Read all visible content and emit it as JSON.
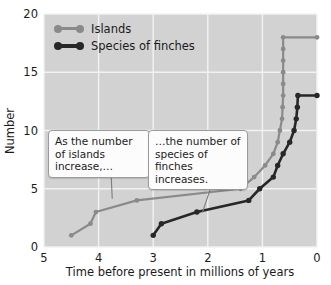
{
  "chart_data": {
    "type": "line",
    "title": "",
    "xlabel": "Time before present in millions of years",
    "ylabel": "Number",
    "xlim": [
      5,
      0
    ],
    "ylim": [
      0,
      20
    ],
    "xticks": [
      "5",
      "4",
      "3",
      "2",
      "1",
      "0"
    ],
    "yticks": [
      "0",
      "5",
      "10",
      "15",
      "20"
    ],
    "grid": true,
    "legend_position": "top-left",
    "series": [
      {
        "name": "Islands",
        "color": "#8a8a8a",
        "points": [
          [
            4.5,
            1
          ],
          [
            4.15,
            2
          ],
          [
            4.05,
            3
          ],
          [
            3.3,
            4
          ],
          [
            1.4,
            5
          ],
          [
            1.15,
            6
          ],
          [
            0.95,
            7
          ],
          [
            0.8,
            8
          ],
          [
            0.72,
            9
          ],
          [
            0.68,
            10
          ],
          [
            0.64,
            11
          ],
          [
            0.63,
            12
          ],
          [
            0.62,
            13
          ],
          [
            0.62,
            14
          ],
          [
            0.62,
            15
          ],
          [
            0.62,
            16
          ],
          [
            0.62,
            17
          ],
          [
            0.62,
            18
          ],
          [
            0.0,
            18
          ]
        ]
      },
      {
        "name": "Species of finches",
        "color": "#272727",
        "points": [
          [
            3.0,
            1
          ],
          [
            2.85,
            2
          ],
          [
            2.2,
            3
          ],
          [
            1.25,
            4
          ],
          [
            1.05,
            5
          ],
          [
            0.8,
            6
          ],
          [
            0.72,
            7
          ],
          [
            0.62,
            8
          ],
          [
            0.5,
            9
          ],
          [
            0.42,
            10
          ],
          [
            0.38,
            11
          ],
          [
            0.36,
            12
          ],
          [
            0.35,
            13
          ],
          [
            0.0,
            13
          ]
        ]
      }
    ],
    "annotations": [
      {
        "id": "callout1",
        "text": "As the number of islands increase,…",
        "anchor": [
          3.75,
          4.15
        ]
      },
      {
        "id": "callout2",
        "text": "…the number of species of finches increases.",
        "anchor": [
          2.1,
          2.95
        ]
      }
    ]
  },
  "legend": {
    "items": [
      {
        "label": "Islands"
      },
      {
        "label": "Species of finches"
      }
    ]
  },
  "colors": {
    "plot_background": "#d2d2d2",
    "gridline": "#f2f2f2",
    "islands": "#8a8a8a",
    "finches": "#272727",
    "text": "#1b1b1b"
  }
}
